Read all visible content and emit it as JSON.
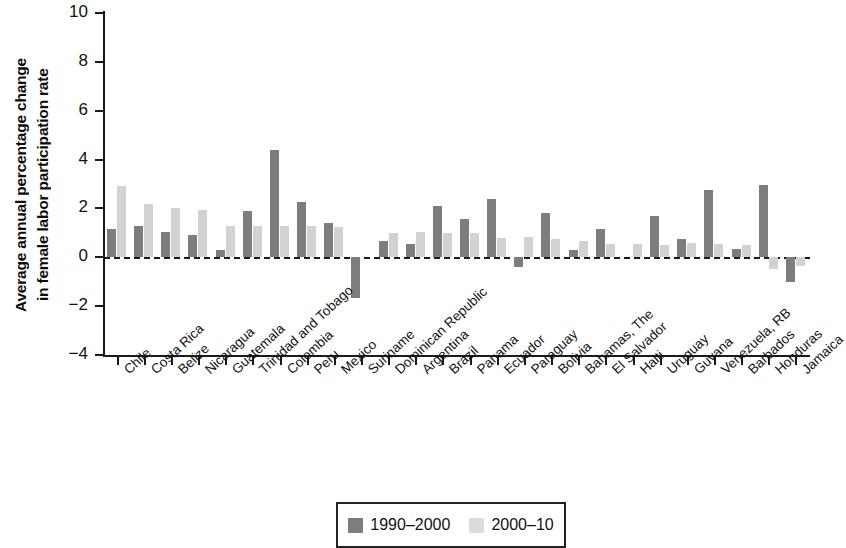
{
  "chart_data": {
    "type": "bar",
    "title": "",
    "xlabel": "",
    "ylabel": "Average annual percentage change in female labor participation rate",
    "ylabel_lines": [
      "Average annual percentage change",
      "in female labor participation rate"
    ],
    "ylim": [
      -4,
      10
    ],
    "yticks": [
      -4,
      -2,
      0,
      2,
      4,
      6,
      8,
      10
    ],
    "ytick_labels": [
      "-4",
      "-2",
      "0",
      "2",
      "4",
      "6",
      "8",
      "10"
    ],
    "grid": false,
    "zero_line": true,
    "legend_position": "bottom-center",
    "categories": [
      "Chile",
      "Costa Rica",
      "Belize",
      "Nicaragua",
      "Guatemala",
      "Trinidad and Tobago",
      "Colombia",
      "Peru",
      "Mexico",
      "Suriname",
      "Dominican Republic",
      "Argentina",
      "Brazil",
      "Panama",
      "Ecuador",
      "Paraguay",
      "Bolivia",
      "Bahamas, The",
      "El Salvador",
      "Haiti",
      "Uruguay",
      "Guyana",
      "Venezuela, RB",
      "Barbados",
      "Honduras",
      "Jamaica"
    ],
    "series": [
      {
        "name": "1990-2000",
        "color": "#7d7d7d",
        "values": [
          1.15,
          1.3,
          1.05,
          0.9,
          0.3,
          1.9,
          4.4,
          2.25,
          1.4,
          -1.65,
          0.65,
          0.55,
          2.1,
          1.55,
          2.4,
          -0.4,
          1.8,
          0.3,
          1.15,
          0.0,
          1.7,
          0.75,
          2.75,
          0.35,
          2.95,
          -1.0
        ]
      },
      {
        "name": "2000-10",
        "color": "#d2d2d2",
        "values": [
          2.9,
          2.2,
          2.0,
          1.95,
          1.3,
          1.3,
          1.3,
          1.3,
          1.25,
          0.0,
          1.0,
          1.05,
          1.0,
          1.0,
          0.8,
          0.85,
          0.75,
          0.65,
          0.55,
          0.55,
          0.5,
          0.6,
          0.55,
          0.5,
          -0.5,
          -0.35
        ]
      }
    ]
  },
  "legend": {
    "entries": [
      {
        "label": "1990–2000",
        "swatch": "dark"
      },
      {
        "label": "2000–10",
        "swatch": "light"
      }
    ]
  }
}
